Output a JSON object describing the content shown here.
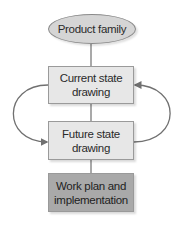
{
  "diagram": {
    "type": "flowchart",
    "nodes": [
      {
        "id": "n0",
        "shape": "ellipse",
        "label": "Product family",
        "fill": "#d5d5d5"
      },
      {
        "id": "n1",
        "shape": "rect",
        "label_line1": "Current state",
        "label_line2": "drawing",
        "fill": "#e7e7e7"
      },
      {
        "id": "n2",
        "shape": "rect",
        "label_line1": "Future state",
        "label_line2": "drawing",
        "fill": "#e7e7e7"
      },
      {
        "id": "n3",
        "shape": "rect",
        "label_line1": "Work plan and",
        "label_line2": "implementation",
        "fill": "#a9a9a9"
      }
    ],
    "edges": [
      {
        "from": "n0",
        "to": "n1",
        "style": "line"
      },
      {
        "from": "n1",
        "to": "n2",
        "style": "line"
      },
      {
        "from": "n2",
        "to": "n3",
        "style": "line"
      },
      {
        "from": "n1",
        "to": "n2",
        "style": "curved-arrow-left"
      },
      {
        "from": "n2",
        "to": "n1",
        "style": "curved-arrow-right"
      }
    ],
    "colors": {
      "line": "#707070",
      "border": "#9a9a9a",
      "text": "#2a2a2a"
    }
  }
}
